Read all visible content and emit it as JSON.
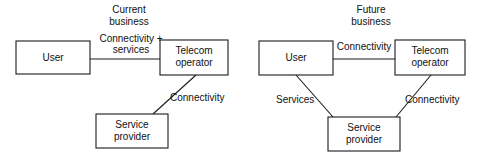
{
  "canvas": {
    "width": 482,
    "height": 156,
    "background": "#ffffff",
    "stroke_color": "#1a1a1a",
    "text_color": "#111111"
  },
  "diagrams": [
    {
      "id": "current-business",
      "title_line1": "Current",
      "title_line2": "business",
      "nodes": [
        {
          "id": "user",
          "label_line1": "User",
          "label_line2": ""
        },
        {
          "id": "telecom-operator",
          "label_line1": "Telecom",
          "label_line2": "operator"
        },
        {
          "id": "service-provider",
          "label_line1": "Service",
          "label_line2": "provider"
        }
      ],
      "edges": [
        {
          "id": "user-to-telecom",
          "from": "user",
          "to": "telecom-operator",
          "label_line1": "Connectivity +",
          "label_line2": "services"
        },
        {
          "id": "telecom-to-provider",
          "from": "telecom-operator",
          "to": "service-provider",
          "label_line1": "Connectivity",
          "label_line2": ""
        }
      ]
    },
    {
      "id": "future-business",
      "title_line1": "Future",
      "title_line2": "business",
      "nodes": [
        {
          "id": "user",
          "label_line1": "User",
          "label_line2": ""
        },
        {
          "id": "telecom-operator",
          "label_line1": "Telecom",
          "label_line2": "operator"
        },
        {
          "id": "service-provider",
          "label_line1": "Service",
          "label_line2": "provider"
        }
      ],
      "edges": [
        {
          "id": "user-to-telecom",
          "from": "user",
          "to": "telecom-operator",
          "label_line1": "Connectivity",
          "label_line2": ""
        },
        {
          "id": "user-to-provider",
          "from": "user",
          "to": "service-provider",
          "label_line1": "Services",
          "label_line2": ""
        },
        {
          "id": "telecom-to-provider",
          "from": "telecom-operator",
          "to": "service-provider",
          "label_line1": "Connectivity",
          "label_line2": ""
        }
      ]
    }
  ]
}
